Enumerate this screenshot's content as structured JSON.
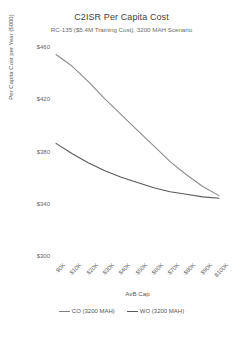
{
  "chart_data": {
    "type": "line",
    "title": "C2ISR Per Capita Cost",
    "subtitle": "RC-135 ($5.4M Training Cost), 3200 MAH Scenario",
    "xlabel": "AvB Cap",
    "ylabel": "Per Capita Cost per Year ($000)",
    "grid": false,
    "legend_position": "bottom",
    "xlim": [
      0,
      100
    ],
    "ylim": [
      300,
      460
    ],
    "categories": [
      "$0K",
      "$10K",
      "$20K",
      "$30K",
      "$40K",
      "$50K",
      "$60K",
      "$70K",
      "$80K",
      "$90K",
      "$100K"
    ],
    "x": [
      0,
      10,
      20,
      30,
      40,
      50,
      60,
      70,
      80,
      90,
      100
    ],
    "ytick_labels": [
      "$460",
      "$420",
      "$380",
      "$340",
      "$300"
    ],
    "ytick_values": [
      460,
      420,
      380,
      340,
      300
    ],
    "series": [
      {
        "name": "CO (3200 MAH)",
        "color": "#8c8c8c",
        "values": [
          455,
          446,
          434,
          421,
          409,
          397,
          385,
          373,
          363,
          354,
          347
        ]
      },
      {
        "name": "WO (3200 MAH)",
        "color": "#595959",
        "values": [
          387,
          379,
          372,
          366,
          361,
          357,
          353,
          350,
          348,
          346,
          345
        ]
      }
    ]
  },
  "legend": {
    "entries": [
      {
        "label": "CO (3200 MAH)"
      },
      {
        "label": "WO (3200 MAH)"
      }
    ]
  }
}
